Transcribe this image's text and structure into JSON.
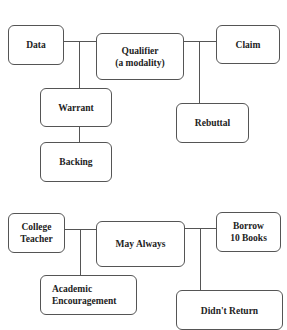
{
  "diagram_top": {
    "name": "Toulmin model",
    "nodes": {
      "data": "Data",
      "qualifier": "Qualifier\n(a modality)",
      "claim": "Claim",
      "warrant": "Warrant",
      "rebuttal": "Rebuttal",
      "backing": "Backing"
    }
  },
  "diagram_bottom": {
    "name": "Example",
    "nodes": {
      "data": "College\nTeacher",
      "qualifier": "May Always",
      "claim": "Borrow\n10 Books",
      "warrant": "Academic\nEncouragement",
      "rebuttal": "Didn't Return"
    }
  }
}
